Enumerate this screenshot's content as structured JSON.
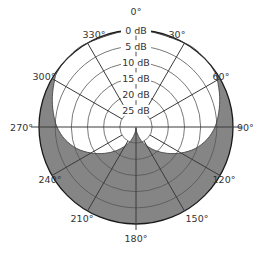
{
  "diagram": {
    "type": "polar-pickup-pattern",
    "center": [
      136,
      127
    ],
    "outer_radius": 97,
    "colors": {
      "background": "#ffffff",
      "fill_outside_pattern": "#858585",
      "grid_line": "#3a3a3a",
      "ring_line": "#555555",
      "label_text": "#333333"
    },
    "angle_labels": [
      {
        "text": "0°",
        "angle": 0
      },
      {
        "text": "30°",
        "angle": 30
      },
      {
        "text": "60°",
        "angle": 60
      },
      {
        "text": "90°",
        "angle": 90
      },
      {
        "text": "120°",
        "angle": 120
      },
      {
        "text": "150°",
        "angle": 150
      },
      {
        "text": "180°",
        "angle": 180
      },
      {
        "text": "210°",
        "angle": 210
      },
      {
        "text": "240°",
        "angle": 240
      },
      {
        "text": "270°",
        "angle": 270
      },
      {
        "text": "300°",
        "angle": 300
      },
      {
        "text": "330°",
        "angle": 330
      }
    ],
    "db_rings": [
      {
        "text": "0 dB",
        "db": 0
      },
      {
        "text": "5 dB",
        "db": 5
      },
      {
        "text": "10 dB",
        "db": 10
      },
      {
        "text": "15 dB",
        "db": 15
      },
      {
        "text": "20 dB",
        "db": 20
      },
      {
        "text": "25 dB",
        "db": 25
      }
    ],
    "response_curve": {
      "description": "Supercardioid-like pattern; white region is the response, grey is the area outside it",
      "points_angle_radius": [
        [
          0,
          97
        ],
        [
          30,
          97
        ],
        [
          45,
          97
        ],
        [
          55,
          96
        ],
        [
          60,
          94
        ],
        [
          70,
          89
        ],
        [
          80,
          84
        ],
        [
          90,
          79
        ],
        [
          100,
          72
        ],
        [
          110,
          63
        ],
        [
          120,
          52
        ],
        [
          130,
          41
        ],
        [
          140,
          31
        ],
        [
          150,
          22
        ],
        [
          160,
          14
        ],
        [
          170,
          6
        ],
        [
          180,
          1
        ],
        [
          190,
          6
        ],
        [
          200,
          14
        ],
        [
          210,
          22
        ],
        [
          220,
          31
        ],
        [
          230,
          41
        ],
        [
          240,
          52
        ],
        [
          250,
          63
        ],
        [
          260,
          72
        ],
        [
          270,
          79
        ],
        [
          280,
          84
        ],
        [
          290,
          89
        ],
        [
          300,
          94
        ],
        [
          305,
          96
        ],
        [
          315,
          97
        ],
        [
          330,
          97
        ]
      ]
    }
  }
}
